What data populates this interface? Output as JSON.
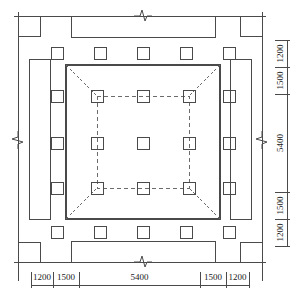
{
  "drawing": {
    "type": "structural-plan",
    "title": "",
    "units": "mm",
    "line_colors": {
      "solid": "#4a4a4a",
      "dashed": "#6b6b6b",
      "dimension": "#1a1a1a",
      "background": "#ffffff"
    }
  },
  "dimensions": {
    "bottom": {
      "label": "horizontal-dimension-chain",
      "segments": [
        {
          "value": "1200",
          "x_start": 31,
          "x_end": 53
        },
        {
          "value": "1500",
          "x_start": 53,
          "x_end": 79
        },
        {
          "value": "5400",
          "x_start": 79,
          "x_end": 200
        },
        {
          "value": "1500",
          "x_start": 200,
          "x_end": 226
        },
        {
          "value": "1200",
          "x_start": 226,
          "x_end": 249
        }
      ],
      "line_y": 285,
      "text_y": 278
    },
    "right": {
      "label": "vertical-dimension-chain",
      "segments": [
        {
          "value": "1200",
          "y_start": 40,
          "y_end": 67
        },
        {
          "value": "1500",
          "y_start": 67,
          "y_end": 94
        },
        {
          "value": "5400",
          "y_start": 94,
          "y_end": 192
        },
        {
          "value": "1500",
          "y_start": 192,
          "y_end": 219
        },
        {
          "value": "1200",
          "y_start": 219,
          "y_end": 246
        }
      ],
      "line_x": 287,
      "text_x": 281
    }
  },
  "geometry": {
    "outer_boundary": {
      "name": "outer-boundary-lines",
      "top_y": 16,
      "bottom_y": 262,
      "left_x": 18,
      "right_x": 262,
      "x_min": 14,
      "x_max": 266,
      "y_min": 12,
      "y_max": 266
    },
    "corner_blocks": [
      {
        "name": "corner-block-top-left",
        "x": 18,
        "y": 16,
        "w": 22,
        "h": 20
      },
      {
        "name": "corner-block-top-right",
        "x": 240,
        "y": 16,
        "w": 22,
        "h": 20
      },
      {
        "name": "corner-block-bottom-left",
        "x": 18,
        "y": 242,
        "w": 22,
        "h": 20
      },
      {
        "name": "corner-block-bottom-right",
        "x": 240,
        "y": 242,
        "w": 22,
        "h": 20
      }
    ],
    "edge_bands": [
      {
        "name": "edge-band-top",
        "x": 71,
        "y": 16,
        "w": 144,
        "h": 21,
        "break": "horizontal",
        "break_cx": 143,
        "break_cy": 16
      },
      {
        "name": "edge-band-bottom",
        "x": 71,
        "y": 241,
        "w": 144,
        "h": 21,
        "break": "horizontal",
        "break_cx": 143,
        "break_cy": 262
      },
      {
        "name": "edge-band-left",
        "x": 29,
        "y": 59,
        "w": 21,
        "h": 160,
        "break": "vertical",
        "break_cx": 18,
        "break_cy": 140
      },
      {
        "name": "edge-band-right",
        "x": 230,
        "y": 59,
        "w": 21,
        "h": 160,
        "break": "vertical",
        "break_cx": 262,
        "break_cy": 140
      }
    ],
    "inner_square": {
      "name": "inner-solid-square",
      "x": 66,
      "y": 65,
      "w": 154,
      "h": 154
    },
    "inner_dashed_square": {
      "name": "inner-dashed-square",
      "x": 97,
      "y": 96,
      "w": 92,
      "h": 92
    },
    "hip_diagonals": [
      {
        "name": "hip-diagonal-top-left",
        "x1": 66,
        "y1": 65,
        "x2": 97,
        "y2": 96
      },
      {
        "name": "hip-diagonal-top-right",
        "x1": 220,
        "y1": 65,
        "x2": 189,
        "y2": 96
      },
      {
        "name": "hip-diagonal-bottom-left",
        "x1": 66,
        "y1": 219,
        "x2": 97,
        "y2": 188
      },
      {
        "name": "hip-diagonal-bottom-right",
        "x1": 220,
        "y1": 219,
        "x2": 189,
        "y2": 188
      }
    ],
    "column_size": 12,
    "columns_outer_top": [
      {
        "cx": 57,
        "cy": 53
      },
      {
        "cx": 100,
        "cy": 53
      },
      {
        "cx": 143,
        "cy": 53
      },
      {
        "cx": 186,
        "cy": 53
      },
      {
        "cx": 229,
        "cy": 53
      }
    ],
    "columns_outer_bottom": [
      {
        "cx": 57,
        "cy": 232
      },
      {
        "cx": 100,
        "cy": 232
      },
      {
        "cx": 143,
        "cy": 232
      },
      {
        "cx": 186,
        "cy": 232
      },
      {
        "cx": 229,
        "cy": 232
      }
    ],
    "columns_outer_left": [
      {
        "cx": 57,
        "cy": 96
      },
      {
        "cx": 57,
        "cy": 143
      },
      {
        "cx": 57,
        "cy": 188
      }
    ],
    "columns_outer_right": [
      {
        "cx": 229,
        "cy": 96
      },
      {
        "cx": 229,
        "cy": 143
      },
      {
        "cx": 229,
        "cy": 188
      }
    ],
    "columns_inner": [
      {
        "cx": 97,
        "cy": 96
      },
      {
        "cx": 143,
        "cy": 96
      },
      {
        "cx": 189,
        "cy": 96
      },
      {
        "cx": 97,
        "cy": 143
      },
      {
        "cx": 143,
        "cy": 143
      },
      {
        "cx": 189,
        "cy": 143
      },
      {
        "cx": 97,
        "cy": 188
      },
      {
        "cx": 143,
        "cy": 188
      },
      {
        "cx": 189,
        "cy": 188
      }
    ]
  }
}
